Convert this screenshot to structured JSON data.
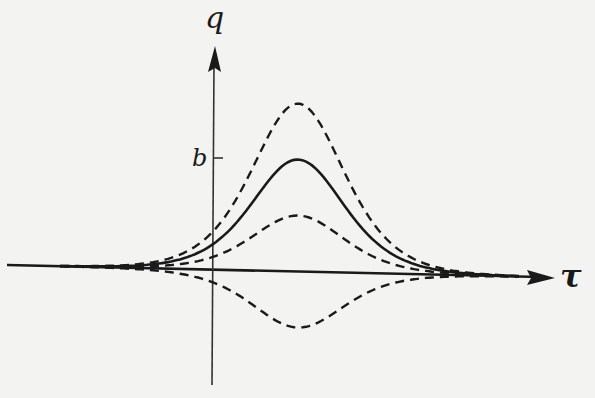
{
  "figure": {
    "y_axis_label": "q",
    "x_axis_label": "τ",
    "tick_label": "b",
    "colors": {
      "background": "#f3f3f2",
      "ink": "#1a1a1a"
    }
  },
  "chart_data": {
    "type": "line",
    "title": "",
    "xlabel": "τ",
    "ylabel": "q",
    "y_ticks": [
      "b"
    ],
    "grid": false,
    "legend": "none",
    "series": [
      {
        "name": "solution (solid)",
        "style": "solid",
        "peak_relative_to_b": 1.0,
        "shape": "bell"
      },
      {
        "name": "upper perturbation",
        "style": "dashed",
        "peak_relative_to_b": 1.5,
        "shape": "bell"
      },
      {
        "name": "middle perturbation",
        "style": "dashed",
        "peak_relative_to_b": 0.5,
        "shape": "bell"
      },
      {
        "name": "lower perturbation",
        "style": "dashed",
        "peak_relative_to_b": -0.5,
        "shape": "inverted bell"
      }
    ]
  }
}
